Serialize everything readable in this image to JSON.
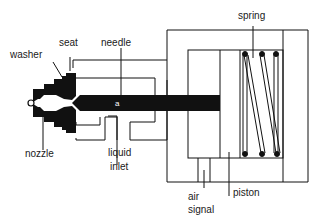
{
  "diagram": {
    "type": "cross-section",
    "colors": {
      "ink": "#111111",
      "background": "#ffffff"
    },
    "labels": {
      "washer": "washer",
      "seat": "seat",
      "needle": "needle",
      "spring": "spring",
      "nozzle": "nozzle",
      "liquid_inlet_line1": "liquid",
      "liquid_inlet_line2": "inlet",
      "air_signal_line1": "air",
      "air_signal_line2": "signal",
      "piston": "piston"
    }
  }
}
